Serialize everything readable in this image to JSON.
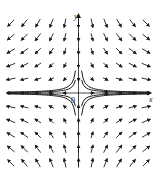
{
  "diagram": {
    "type": "phase-portrait",
    "system": "saddle point at origin",
    "axes": {
      "x_label": "x",
      "y_label": "y",
      "origin_label": "0"
    },
    "colors": {
      "stroke": "#1a1a1a",
      "background": "#ffffff"
    },
    "field": {
      "description": "x' = x, y' = -y",
      "grid_cols": 11,
      "grid_rows": 11
    },
    "trajectories": [
      {
        "quadrant": "I",
        "count": 2
      },
      {
        "quadrant": "II",
        "count": 2
      },
      {
        "quadrant": "III",
        "count": 2
      },
      {
        "quadrant": "IV",
        "count": 2
      }
    ]
  }
}
